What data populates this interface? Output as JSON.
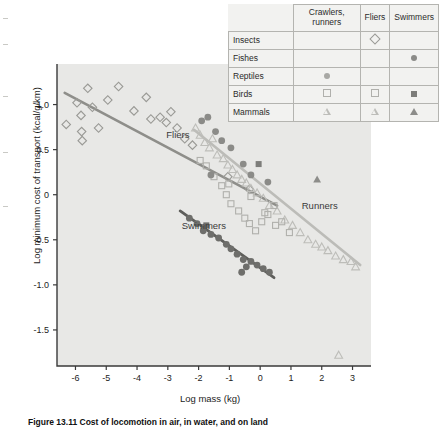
{
  "figure": {
    "caption": "Figure 13.11   Cost of locomotion in air, in water, and on land",
    "background": "#e8e8e6",
    "frame_color": "#3a3a3a"
  },
  "legend": {
    "name": "locomotion-mode-legend",
    "columns": [
      "",
      "Crawlers, runners",
      "Fliers",
      "Swimmers"
    ],
    "rows": [
      {
        "label": "Insects",
        "crawlers_runners": "",
        "fliers": "diamond-open",
        "swimmers": ""
      },
      {
        "label": "Fishes",
        "crawlers_runners": "",
        "fliers": "",
        "swimmers": "circle-dark"
      },
      {
        "label": "Reptiles",
        "crawlers_runners": "circle-mid",
        "fliers": "",
        "swimmers": ""
      },
      {
        "label": "Birds",
        "crawlers_runners": "square-open",
        "fliers": "square-open",
        "swimmers": "square-fill"
      },
      {
        "label": "Mammals",
        "crawlers_runners": "triangle-open",
        "fliers": "triangle-open",
        "swimmers": "triangle-fill"
      }
    ]
  },
  "chart_data": {
    "type": "scatter",
    "title": "",
    "xlabel": "Log mass (kg)",
    "ylabel": "Log minimum cost of transport (kcal/g/km)",
    "xlim": [
      -6.6,
      3.6
    ],
    "ylim": [
      -1.9,
      1.45
    ],
    "xticks": [
      -6,
      -5,
      -4,
      -3,
      -2,
      -1,
      0,
      1,
      2,
      3
    ],
    "xticklabels": [
      "-6",
      "-5",
      "-4",
      "-3",
      "-2",
      "-1",
      "0",
      "1",
      "2",
      "3"
    ],
    "yticks": [
      1.0,
      0.5,
      0,
      -0.5,
      -1.0,
      -1.5
    ],
    "yticklabels": [
      "1.0",
      "0.5",
      "0",
      "-0.5",
      "-1.0",
      "-1.5"
    ],
    "grid": false,
    "legend_position": "top-right",
    "annotations": [
      {
        "text": "Fliers",
        "x": -3.05,
        "y": 0.63
      },
      {
        "text": "Runners",
        "x": 1.35,
        "y": -0.16
      },
      {
        "text": "Swimmers",
        "x": -2.55,
        "y": -0.38
      }
    ],
    "series": [
      {
        "name": "Fliers",
        "marker": "diamond-open",
        "color": "#9a9a96",
        "trendline": {
          "x1": -6.35,
          "y1": 1.13,
          "x2": 0.55,
          "y2": -0.12,
          "color": "#8e8e8a",
          "width": 2.6
        },
        "points": [
          {
            "x": -6.3,
            "y": 0.78
          },
          {
            "x": -5.95,
            "y": 1.02
          },
          {
            "x": -5.82,
            "y": 0.88
          },
          {
            "x": -5.8,
            "y": 0.7
          },
          {
            "x": -5.78,
            "y": 0.6
          },
          {
            "x": -5.6,
            "y": 1.18
          },
          {
            "x": -5.45,
            "y": 0.97
          },
          {
            "x": -5.25,
            "y": 0.74
          },
          {
            "x": -4.95,
            "y": 1.05
          },
          {
            "x": -4.6,
            "y": 1.2
          },
          {
            "x": -4.1,
            "y": 0.93
          },
          {
            "x": -3.7,
            "y": 1.08
          },
          {
            "x": -3.55,
            "y": 0.84
          },
          {
            "x": -3.25,
            "y": 0.86
          },
          {
            "x": -3.05,
            "y": 0.8
          },
          {
            "x": -2.9,
            "y": 0.92
          },
          {
            "x": -2.7,
            "y": 0.74
          },
          {
            "x": -2.45,
            "y": 0.62
          },
          {
            "x": -2.2,
            "y": 0.55
          },
          {
            "x": -1.05,
            "y": 0.2
          },
          {
            "x": -0.35,
            "y": 0.06
          }
        ]
      },
      {
        "name": "Fliers-birds",
        "marker": "square-open",
        "color": "#b0b0ac",
        "points": [
          {
            "x": -1.02,
            "y": 0.12
          },
          {
            "x": -0.3,
            "y": -0.02
          },
          {
            "x": 0.15,
            "y": -0.2
          },
          {
            "x": 0.5,
            "y": -0.34
          },
          {
            "x": 0.95,
            "y": -0.42
          }
        ]
      },
      {
        "name": "Runners",
        "marker": "triangle-open",
        "color": "#bdbdb9",
        "trendline": {
          "x1": -2.15,
          "y1": 0.72,
          "x2": 3.25,
          "y2": -0.78,
          "color": "#bcbcb8",
          "width": 2.6
        },
        "points": [
          {
            "x": -2.1,
            "y": 0.74
          },
          {
            "x": -1.95,
            "y": 0.66
          },
          {
            "x": -1.8,
            "y": 0.58
          },
          {
            "x": -1.65,
            "y": 0.52
          },
          {
            "x": -1.55,
            "y": 0.62
          },
          {
            "x": -1.4,
            "y": 0.44
          },
          {
            "x": -1.2,
            "y": 0.4
          },
          {
            "x": -1.05,
            "y": 0.33
          },
          {
            "x": -0.9,
            "y": 0.28
          },
          {
            "x": -0.75,
            "y": 0.22
          },
          {
            "x": -0.6,
            "y": 0.17
          },
          {
            "x": -0.45,
            "y": 0.13
          },
          {
            "x": -0.3,
            "y": 0.07
          },
          {
            "x": -0.1,
            "y": 0.02
          },
          {
            "x": 0.1,
            "y": -0.04
          },
          {
            "x": 0.3,
            "y": -0.12
          },
          {
            "x": 0.55,
            "y": -0.18
          },
          {
            "x": 0.8,
            "y": -0.28
          },
          {
            "x": 1.05,
            "y": -0.34
          },
          {
            "x": 1.3,
            "y": -0.42
          },
          {
            "x": 1.55,
            "y": -0.5
          },
          {
            "x": 1.8,
            "y": -0.55
          },
          {
            "x": 2.0,
            "y": -0.58
          },
          {
            "x": 2.2,
            "y": -0.62
          },
          {
            "x": 2.45,
            "y": -0.68
          },
          {
            "x": 2.7,
            "y": -0.72
          },
          {
            "x": 2.95,
            "y": -0.74
          },
          {
            "x": 3.1,
            "y": -0.8
          },
          {
            "x": 2.55,
            "y": -1.78
          }
        ]
      },
      {
        "name": "Runners-mammals-filled",
        "marker": "triangle-fill",
        "color": "#8d8d8a",
        "points": [
          {
            "x": 1.85,
            "y": 0.17
          }
        ]
      },
      {
        "name": "Runners-birds",
        "marker": "square-open",
        "color": "#b0b0ac",
        "points": [
          {
            "x": -1.95,
            "y": 0.38
          },
          {
            "x": -1.75,
            "y": 0.32
          },
          {
            "x": -1.5,
            "y": 0.2
          },
          {
            "x": -1.25,
            "y": 0.1
          },
          {
            "x": -1.1,
            "y": 0.0
          },
          {
            "x": -0.95,
            "y": -0.1
          },
          {
            "x": -0.7,
            "y": -0.18
          },
          {
            "x": -0.5,
            "y": -0.26
          },
          {
            "x": -0.35,
            "y": -0.32
          },
          {
            "x": -0.15,
            "y": -0.4
          },
          {
            "x": 0.05,
            "y": -0.3
          },
          {
            "x": 0.25,
            "y": -0.22
          },
          {
            "x": 0.45,
            "y": -0.12
          },
          {
            "x": 0.7,
            "y": -0.3
          }
        ]
      },
      {
        "name": "Runners-reptiles",
        "marker": "circle-mid",
        "color": "#8b8b88",
        "points": [
          {
            "x": -1.9,
            "y": 0.82
          },
          {
            "x": -1.7,
            "y": 0.86
          },
          {
            "x": -1.45,
            "y": 0.7
          },
          {
            "x": -1.25,
            "y": 0.6
          },
          {
            "x": -0.95,
            "y": 0.52
          },
          {
            "x": -0.55,
            "y": 0.34
          },
          {
            "x": -0.3,
            "y": 0.22
          },
          {
            "x": 0.25,
            "y": 0.14
          },
          {
            "x": -1.6,
            "y": 0.22
          }
        ]
      },
      {
        "name": "Runners-birds-filled",
        "marker": "square-fill",
        "color": "#7d7d7a",
        "points": [
          {
            "x": -0.05,
            "y": 0.34
          }
        ]
      },
      {
        "name": "Swimmers",
        "marker": "circle-dark",
        "color": "#6e6e6b",
        "trendline": {
          "x1": -2.6,
          "y1": -0.18,
          "x2": 0.45,
          "y2": -0.92,
          "color": "#5e5e5b",
          "width": 2.8
        },
        "points": [
          {
            "x": -2.3,
            "y": -0.26
          },
          {
            "x": -2.05,
            "y": -0.32
          },
          {
            "x": -1.85,
            "y": -0.4
          },
          {
            "x": -1.6,
            "y": -0.44
          },
          {
            "x": -1.35,
            "y": -0.48
          },
          {
            "x": -1.1,
            "y": -0.55
          },
          {
            "x": -0.95,
            "y": -0.6
          },
          {
            "x": -0.75,
            "y": -0.66
          },
          {
            "x": -0.55,
            "y": -0.72
          },
          {
            "x": -0.45,
            "y": -0.8
          },
          {
            "x": -0.3,
            "y": -0.74
          },
          {
            "x": -0.1,
            "y": -0.78
          },
          {
            "x": 0.1,
            "y": -0.82
          },
          {
            "x": 0.3,
            "y": -0.86
          },
          {
            "x": -0.6,
            "y": -0.86
          }
        ]
      },
      {
        "name": "Swimmers-birds-filled",
        "marker": "square-fill",
        "color": "#6e6e6b",
        "points": [
          {
            "x": -1.75,
            "y": -0.34
          }
        ]
      }
    ]
  }
}
